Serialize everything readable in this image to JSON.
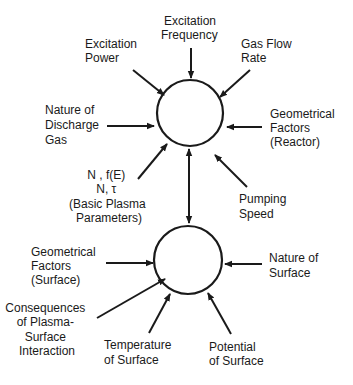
{
  "colors": {
    "ink": "#1a1a1a",
    "background": "#ffffff"
  },
  "nodes": {
    "plasma": {
      "label": ""
    },
    "surface": {
      "label": ""
    }
  },
  "plasma_inputs": {
    "excitation_power": [
      "Excitation",
      "Power"
    ],
    "excitation_frequency": [
      "Excitation",
      "Frequency"
    ],
    "gas_flow_rate": [
      "Gas Flow",
      "Rate"
    ],
    "nature_of_discharge_gas": [
      "Nature of",
      "Discharge",
      "Gas"
    ],
    "geometrical_factors_reactor": [
      "Geometrical",
      "Factors",
      "(Reactor)"
    ],
    "basic_plasma_parameters": [
      "N , f(E)",
      "N, τ",
      "(Basic Plasma",
      "Parameters)"
    ],
    "pumping_speed": [
      "Pumping",
      "Speed"
    ]
  },
  "surface_inputs": {
    "geometrical_factors_surface": [
      "Geometrical",
      "Factors",
      "(Surface)"
    ],
    "nature_of_surface": [
      "Nature of",
      "Surface"
    ],
    "consequences": [
      "Consequences",
      "of Plasma-",
      "Surface",
      "Interaction"
    ],
    "temperature_of_surface": [
      "Temperature",
      "of Surface"
    ],
    "potential_of_surface": [
      "Potential",
      "of Surface"
    ]
  },
  "connection": {
    "type": "bidirectional",
    "from": "plasma",
    "to": "surface"
  }
}
